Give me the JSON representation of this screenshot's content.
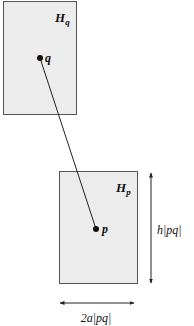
{
  "diagram": {
    "boxes": {
      "hq": {
        "label_main": "H",
        "label_sub": "q",
        "fill": "#ececec",
        "stroke": "#555555"
      },
      "hp": {
        "label_main": "H",
        "label_sub": "p",
        "fill": "#ececec",
        "stroke": "#555555"
      }
    },
    "points": {
      "q": {
        "label": "q"
      },
      "p": {
        "label": "p"
      }
    },
    "segment": {
      "from": "q",
      "to": "p"
    },
    "dimensions": {
      "height": {
        "label": "h|pq|"
      },
      "width": {
        "label": "2a|pq|"
      }
    }
  }
}
